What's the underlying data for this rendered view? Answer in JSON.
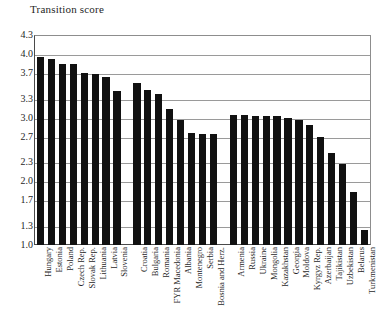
{
  "chart_data": {
    "type": "bar",
    "title": "Transition score",
    "xlabel": "",
    "ylabel": "Transition score",
    "ylim": [
      1.0,
      4.3
    ],
    "yticks": [
      "1.0",
      "1.3",
      "1.7",
      "2.0",
      "2.3",
      "2.7",
      "3.0",
      "3.3",
      "3.7",
      "4.0",
      "4.3"
    ],
    "ytick_values": [
      1.0,
      1.3,
      1.7,
      2.0,
      2.3,
      2.7,
      3.0,
      3.3,
      3.7,
      4.0,
      4.3
    ],
    "grid": "horizontal",
    "legend": "none",
    "bar_color": "#111111",
    "groups": [
      {
        "name": "Central Europe and the Baltic states",
        "categories": [
          "Hungary",
          "Estonia",
          "Poland",
          "Czech Rep.",
          "Slovak Rep.",
          "Lithuania",
          "Latvia",
          "Slovenia"
        ],
        "values": [
          3.96,
          3.92,
          3.84,
          3.84,
          3.7,
          3.68,
          3.64,
          3.42
        ]
      },
      {
        "name": "South-eastern Europe",
        "categories": [
          "Croatia",
          "Bulgaria",
          "Romania",
          "FYR Macedonia",
          "Albania",
          "Montenegro",
          "Serbia",
          "Bosnia and Herz."
        ],
        "values": [
          3.54,
          3.44,
          3.37,
          3.13,
          2.96,
          2.76,
          2.75,
          2.74
        ]
      },
      {
        "name": "Commonwealth of Independent States and Mongolia",
        "categories": [
          "Armenia",
          "Russia",
          "Ukraine",
          "Mongolia",
          "Kazakhstan",
          "Georgia",
          "Moldova",
          "Kyrgyz Rep.",
          "Azerbaijan",
          "Tajikistan",
          "Uzbekistan",
          "Belarus",
          "Turkmenistan"
        ],
        "values": [
          3.04,
          3.04,
          3.03,
          3.03,
          3.02,
          3.0,
          2.97,
          2.89,
          2.7,
          2.44,
          2.28,
          1.84,
          1.24
        ]
      }
    ],
    "categories": [
      "Hungary",
      "Estonia",
      "Poland",
      "Czech Rep.",
      "Slovak Rep.",
      "Lithuania",
      "Latvia",
      "Slovenia",
      "Croatia",
      "Bulgaria",
      "Romania",
      "FYR Macedonia",
      "Albania",
      "Montenegro",
      "Serbia",
      "Bosnia and Herz.",
      "Armenia",
      "Russia",
      "Ukraine",
      "Mongolia",
      "Kazakhstan",
      "Georgia",
      "Moldova",
      "Kyrgyz Rep.",
      "Azerbaijan",
      "Tajikistan",
      "Uzbekistan",
      "Belarus",
      "Turkmenistan"
    ],
    "values": [
      3.96,
      3.92,
      3.84,
      3.84,
      3.7,
      3.68,
      3.64,
      3.42,
      3.54,
      3.44,
      3.37,
      3.13,
      2.96,
      2.76,
      2.75,
      2.74,
      3.04,
      3.04,
      3.03,
      3.03,
      3.02,
      3.0,
      2.97,
      2.89,
      2.7,
      2.44,
      2.28,
      1.84,
      1.24
    ]
  }
}
